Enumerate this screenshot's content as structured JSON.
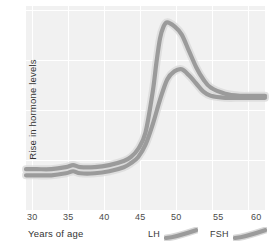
{
  "chart_data": {
    "type": "line",
    "title": "",
    "xlabel": "Years of age",
    "ylabel": "Rise in hormone levels",
    "xticks": [
      "30",
      "35",
      "40",
      "45",
      "50",
      "55",
      "60"
    ],
    "xlim": [
      28.5,
      61.5
    ],
    "ylim": [
      0,
      100
    ],
    "yticks": [],
    "grid": true,
    "legend_position": "below-right",
    "series": [
      {
        "name": "FSH",
        "color": "#9b9b9b",
        "x": [
          28.5,
          30,
          32,
          34,
          35,
          36,
          38,
          40,
          42,
          43,
          44,
          45,
          46,
          46.5,
          47,
          47.5,
          48,
          49,
          50,
          51,
          52,
          53,
          54,
          56,
          58,
          60,
          61.5
        ],
        "values": [
          20,
          20,
          20,
          21,
          22,
          21,
          21,
          22,
          24,
          26,
          30,
          38,
          58,
          72,
          84,
          90,
          92,
          90,
          86,
          78,
          70,
          64,
          60,
          57,
          56,
          56,
          56
        ]
      },
      {
        "name": "LH",
        "color": "#9b9b9b",
        "x": [
          28.5,
          30,
          32,
          34,
          35,
          36,
          38,
          40,
          42,
          43,
          44,
          45,
          46,
          47,
          48,
          49,
          50,
          51,
          52,
          53,
          54,
          56,
          58,
          60,
          61.5
        ],
        "values": [
          17,
          17,
          17,
          18,
          19,
          18,
          18,
          19,
          21,
          23,
          26,
          32,
          42,
          54,
          64,
          68,
          69,
          66,
          62,
          58,
          56,
          55,
          55,
          55,
          55
        ]
      }
    ],
    "legend": [
      {
        "label": "LH",
        "swatch": "curve-stroke"
      },
      {
        "label": "FSH",
        "swatch": "curve-stroke"
      }
    ],
    "colors": {
      "panel_background": "#f1f1f1",
      "gridline": "#ffffff",
      "curve_stroke": "#9b9b9b",
      "curve_halo": "#d8d8d8",
      "text": "#3a3a3a"
    }
  }
}
